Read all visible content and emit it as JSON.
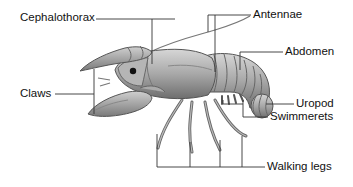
{
  "diagram": {
    "labels": {
      "cephalothorax": "Cephalothorax",
      "antennae": "Antennae",
      "abdomen": "Abdomen",
      "claws": "Claws",
      "uropod": "Uropod",
      "swimmerets": "Swimmerets",
      "walking_legs": "Walking legs"
    },
    "colors": {
      "leader_line": "#333333",
      "body_light": "#c9c9c9",
      "body_mid": "#9a9a9a",
      "body_dark": "#5a5a5a",
      "text": "#111111"
    }
  }
}
